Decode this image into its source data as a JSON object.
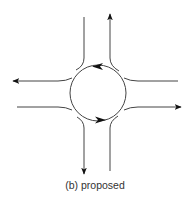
{
  "diagram": {
    "type": "roundabout-traffic-flow",
    "caption": "(b) proposed",
    "colors": {
      "line": "#444444",
      "arrow": "#111111",
      "background": "#ffffff"
    },
    "roundabout": {
      "center": [
        98,
        93
      ],
      "radius": 28,
      "flow_direction": "counter-clockwise"
    },
    "approaches": [
      {
        "name": "north",
        "entry_line_x": 84,
        "exit_line_x": 110,
        "exit_arrow": "up"
      },
      {
        "name": "south",
        "entry_line_x": 110,
        "exit_line_x": 84,
        "exit_arrow": "down"
      },
      {
        "name": "west",
        "entry_line_y": 107,
        "exit_line_y": 81,
        "exit_arrow": "left"
      },
      {
        "name": "east",
        "entry_line_y": 81,
        "exit_line_y": 107,
        "exit_arrow": "right"
      }
    ]
  }
}
